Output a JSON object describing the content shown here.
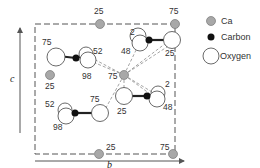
{
  "diagram": {
    "axes": {
      "vertical": "c",
      "horizontal": "b"
    },
    "legend": [
      {
        "label": "Ca",
        "symbol": "ca-icon",
        "color": "#a8a8a8"
      },
      {
        "label": "Carbon",
        "symbol": "carbon-icon",
        "color": "#111111"
      },
      {
        "label": "Oxygen",
        "symbol": "oxygen-icon",
        "color": "#ffffff"
      }
    ],
    "ca_labels": {
      "top_center": "25",
      "top_right": "75",
      "left_mid": "25",
      "center": "75",
      "bottom_center": "25",
      "bottom_right": "75"
    },
    "carbonate_top_left": {
      "o_left": "75",
      "o_top": "52",
      "o_bottom": "98"
    },
    "carbonate_top_right": {
      "o_top": "2",
      "o_bottom": "48",
      "o_right": "25"
    },
    "carbonate_bottom_left": {
      "o_top": "52",
      "o_bottom": "98",
      "o_right": "75"
    },
    "carbonate_bottom_right": {
      "o_left": "25",
      "o_top": "2",
      "o_bottom": "48"
    }
  }
}
